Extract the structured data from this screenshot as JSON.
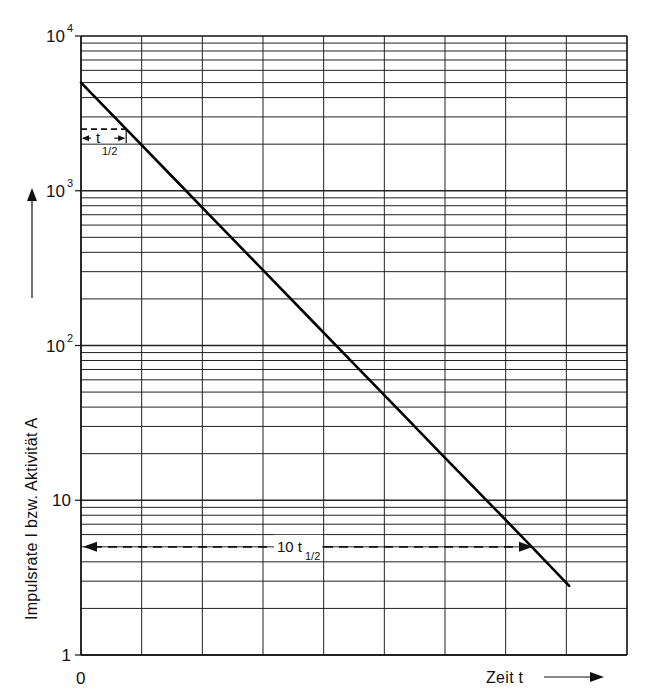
{
  "chart_data": {
    "type": "line",
    "title": "",
    "xlabel": "Zeit t",
    "ylabel": "Impulsrate I bzw. Aktivität A",
    "yscale": "log",
    "ylim": [
      1,
      10000
    ],
    "y_tick_labels": [
      {
        "value": 10000,
        "base": "10",
        "exp": "4"
      },
      {
        "value": 1000,
        "base": "10",
        "exp": "3"
      },
      {
        "value": 100,
        "base": "10",
        "exp": "2"
      },
      {
        "value": 10,
        "base": "10",
        "exp": ""
      },
      {
        "value": 1,
        "base": "1",
        "exp": ""
      }
    ],
    "x_tick_labels": [
      {
        "value": 0,
        "label": "0"
      }
    ],
    "x_unit": "half-lives (t½)",
    "xlim": [
      0,
      12.2
    ],
    "grid": true,
    "legend": null,
    "series": [
      {
        "name": "A(t) = A0 · 2^(-t/t½)",
        "x": [
          0,
          1,
          2,
          3,
          4,
          5,
          6,
          7,
          8,
          9,
          10,
          10.8
        ],
        "values": [
          5000,
          2500,
          1250,
          625,
          312.5,
          156.25,
          78.1,
          39.1,
          19.5,
          9.8,
          4.9,
          2.8
        ]
      }
    ],
    "annotations": [
      {
        "text": "t",
        "sub": "1/2",
        "type": "dashed-bracket",
        "from_x": 0,
        "to_x": 1,
        "at_value": 2500
      },
      {
        "text": "10 t",
        "sub": "1/2",
        "type": "dashed-arrow",
        "from_x": 0,
        "to_x": 10,
        "at_value": 5
      }
    ]
  },
  "labels": {
    "y_axis_title": "Impulsrate I bzw. Aktivität A",
    "x_axis_title": "Zeit t",
    "x_origin": "0",
    "half_life_label": "t",
    "half_life_sub": "1/2",
    "ten_half_life_label": "10 t",
    "ten_half_life_sub": "1/2"
  }
}
